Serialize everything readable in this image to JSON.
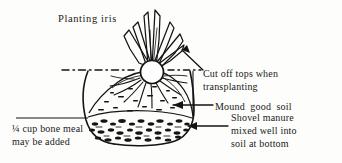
{
  "figure": {
    "title": "Planting iris",
    "background_color": "#fdfdfb",
    "ink_color": "#141414"
  },
  "labels": {
    "title": "Planting iris",
    "cut_tops_line1": "Cut off tops when",
    "cut_tops_line2": "transplanting",
    "mound_soil": "Mound  good  soil",
    "shovel_manure_line1": "Shovel manure",
    "shovel_manure_line2": "mixed well into",
    "shovel_manure_line3": "soil at bottom",
    "bone_meal_line1": "¼ cup bone meal",
    "bone_meal_line2": "may be added"
  },
  "parts": {
    "leaf_fan": "iris-leaf-fan",
    "rhizome": "iris-rhizome",
    "roots": "iris-roots",
    "ground_line": "soil-surface-dash-dot-line",
    "planting_hole": "planting-hole-outline",
    "soil_mound": "mounded-soil-stipple",
    "manure_layer": "manure-gravel-layer"
  },
  "annotations": {
    "arrow_cut_tops": "arrow-to-leaf-tops",
    "arrow_mound": "arrow-to-soil-mound",
    "arrow_manure": "arrow-to-manure-layer",
    "leader_bone_meal": "leader-line-bone-meal"
  }
}
